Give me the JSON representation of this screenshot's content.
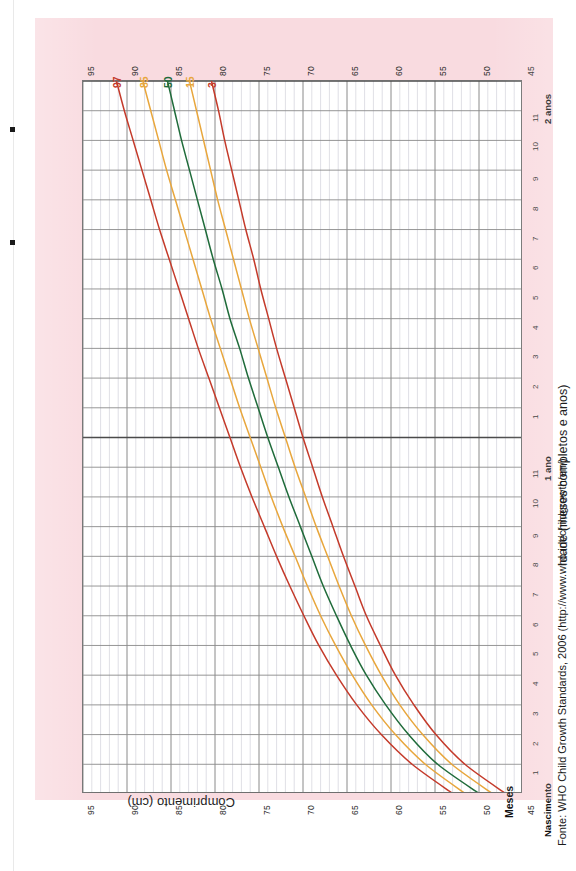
{
  "page": {
    "background_color": "#f9dbe0",
    "plot_background": "#ffffff"
  },
  "source_note": "Fonte: WHO Child Growth Standards, 2006 (http://www.who.int/childgrowth/en/)",
  "axes": {
    "length_axis_title": "Comprimento (cm)",
    "age_axis_title": "Idade (meses completos e anos)",
    "months_label": "Meses",
    "length_ticks": [
      "95",
      "90",
      "85",
      "80",
      "75",
      "70",
      "65",
      "60",
      "55",
      "50",
      "45"
    ],
    "age_ticks": [
      "Nascimento",
      "1",
      "2",
      "3",
      "4",
      "5",
      "6",
      "7",
      "8",
      "9",
      "10",
      "11",
      "1 ano",
      "1",
      "2",
      "3",
      "4",
      "5",
      "6",
      "7",
      "8",
      "9",
      "10",
      "11",
      "2 anos"
    ],
    "age_major_ticks": [
      "Nascimento",
      "1 ano",
      "2 anos"
    ]
  },
  "legend": {
    "percentile_labels": [
      "97",
      "85",
      "50",
      "15",
      "3"
    ]
  },
  "colors": {
    "p97": "#c43a2a",
    "p85": "#e8a63c",
    "p50": "#1f6b3a",
    "p15": "#e8a63c",
    "p3": "#c43a2a",
    "grid_major": "#8a8a8a",
    "grid_minor": "#c9c9d4",
    "frame": "#6f6f6f"
  },
  "chart_data": {
    "type": "line",
    "xlabel": "Idade (meses completos e anos)",
    "ylabel": "Comprimento (cm)",
    "xlim": [
      0,
      24
    ],
    "ylim": [
      45,
      95
    ],
    "grid": true,
    "orientation": "rotated-90-ccw",
    "legend_position": "curve-ends-top",
    "x": [
      0,
      1,
      2,
      3,
      4,
      5,
      6,
      7,
      8,
      9,
      10,
      11,
      12,
      13,
      14,
      15,
      16,
      17,
      18,
      19,
      20,
      21,
      22,
      23,
      24
    ],
    "series": [
      {
        "name": "97",
        "color": "#c43a2a",
        "values": [
          52.9,
          57.6,
          61.1,
          63.9,
          66.2,
          68.2,
          69.9,
          71.5,
          73.0,
          74.4,
          75.8,
          77.1,
          78.3,
          79.5,
          80.7,
          81.9,
          83.0,
          84.1,
          85.2,
          86.3,
          87.3,
          88.3,
          89.3,
          90.3,
          91.2
        ]
      },
      {
        "name": "85",
        "color": "#e8a63c",
        "values": [
          51.5,
          56.1,
          59.5,
          62.2,
          64.4,
          66.3,
          68.0,
          69.5,
          70.9,
          72.3,
          73.6,
          74.8,
          76.0,
          77.2,
          78.3,
          79.4,
          80.5,
          81.5,
          82.5,
          83.5,
          84.5,
          85.5,
          86.4,
          87.3,
          88.2
        ]
      },
      {
        "name": "50",
        "color": "#1f6b3a",
        "values": [
          49.9,
          54.7,
          58.0,
          60.6,
          62.8,
          64.6,
          66.2,
          67.7,
          69.0,
          70.3,
          71.6,
          72.8,
          74.0,
          75.1,
          76.2,
          77.2,
          78.3,
          79.2,
          80.2,
          81.1,
          82.0,
          82.9,
          83.8,
          84.6,
          85.4
        ]
      },
      {
        "name": "15",
        "color": "#e8a63c",
        "values": [
          48.4,
          53.1,
          56.4,
          59.0,
          61.1,
          62.9,
          64.5,
          65.9,
          67.2,
          68.5,
          69.7,
          70.9,
          72.0,
          73.1,
          74.1,
          75.1,
          76.1,
          77.0,
          77.9,
          78.8,
          79.7,
          80.5,
          81.3,
          82.1,
          82.9
        ]
      },
      {
        "name": "3",
        "color": "#c43a2a",
        "values": [
          46.9,
          51.6,
          54.9,
          57.4,
          59.5,
          61.2,
          62.8,
          64.1,
          65.4,
          66.6,
          67.8,
          68.9,
          70.0,
          71.0,
          72.0,
          73.0,
          73.9,
          74.8,
          75.6,
          76.5,
          77.3,
          78.1,
          78.9,
          79.6,
          80.4
        ]
      }
    ]
  }
}
